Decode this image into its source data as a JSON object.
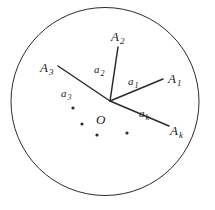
{
  "figure": {
    "background_color": "#ffffff",
    "stroke_color": "#2b2b2b",
    "circle": {
      "name": "boundary-circle",
      "cx": 105,
      "cy": 101.5,
      "r": 94,
      "stroke_width": 1.0
    },
    "center_point": {
      "x": 110,
      "y": 101
    },
    "rays": [
      {
        "id": "ray-a1",
        "arm_label": "a_1",
        "endpoint_label": "A_1",
        "x2": 163,
        "y2": 79,
        "stroke_width": 1.5
      },
      {
        "id": "ray-a2",
        "arm_label": "a_2",
        "endpoint_label": "A_2",
        "x2": 118,
        "y2": 47,
        "stroke_width": 1.5
      },
      {
        "id": "ray-a3",
        "arm_label": "a_3",
        "endpoint_label": "A_3",
        "x2": 58,
        "y2": 66,
        "stroke_width": 1.5
      },
      {
        "id": "ray-ak",
        "arm_label": "a_k",
        "endpoint_label": "A_k",
        "x2": 169,
        "y2": 126,
        "stroke_width": 1.5
      }
    ],
    "ellipsis_dots": [
      {
        "x": 73,
        "y": 108,
        "r": 1.6
      },
      {
        "x": 82,
        "y": 124,
        "r": 1.6
      },
      {
        "x": 97,
        "y": 135,
        "r": 1.6
      },
      {
        "x": 127,
        "y": 133,
        "r": 1.6
      }
    ],
    "labels": {
      "vertex": {
        "base": "O",
        "sub": "",
        "x": 96,
        "y": 111
      },
      "A1": {
        "base": "A",
        "sub": "1",
        "x": 168,
        "y": 70
      },
      "A2": {
        "base": "A",
        "sub": "2",
        "x": 111,
        "y": 28
      },
      "A3": {
        "base": "A",
        "sub": "3",
        "x": 40,
        "y": 59
      },
      "Ak": {
        "base": "A",
        "sub": "k",
        "x": 170,
        "y": 122
      },
      "a1": {
        "base": "a",
        "sub": "1",
        "x": 128,
        "y": 72
      },
      "a2": {
        "base": "a",
        "sub": "2",
        "x": 94,
        "y": 60
      },
      "a3": {
        "base": "a",
        "sub": "3",
        "x": 61,
        "y": 84
      },
      "ak": {
        "base": "a",
        "sub": "k",
        "x": 139,
        "y": 104
      }
    }
  }
}
